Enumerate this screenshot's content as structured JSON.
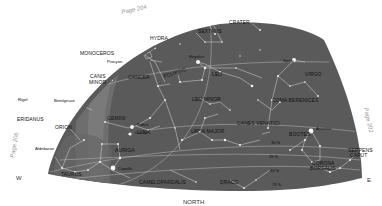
{
  "map": {
    "title": "Star chart - northern sky hemisphere",
    "colors": {
      "sky": "#5a5a5a",
      "milky_way": "#6e6e6e",
      "milky_way_core": "#7a7a7a",
      "constellation_lines": "#d8d8d8",
      "stars": "#f4f4f4",
      "labels": "#111111",
      "page_refs": "#999999"
    },
    "page_refs": {
      "top": "Page 204",
      "left": "Page 206",
      "right": "Page 202"
    },
    "directions": {
      "west": "W",
      "east": "E",
      "north": "NORTH"
    },
    "constellations": {
      "crater": "CRATER",
      "sextans": "SEXTANS",
      "hydra": "HYDRA",
      "monoceros": "MONOCEROS",
      "canis_minor_1": "CANIS",
      "canis_minor_2": "MINOR",
      "cancer": "CANCER",
      "ecliptic": "ECLIPTIC",
      "leo": "LEO",
      "virgo": "VIRGO",
      "leo_minor": "LEO MINOR",
      "coma_berenices": "COMA BERENICES",
      "gemini": "GEMINI",
      "orion": "ORION",
      "eridanus": "ERIDANUS",
      "lynx": "LYNX",
      "canes_venatici": "CANES VENATICI",
      "ursa_major": "URSA MAJOR",
      "bootes": "BOOTES",
      "auriga": "AURIGA",
      "serpens_caput_1": "SERPENS",
      "serpens_caput_2": "CAPUT",
      "corona_borealis_1": "CORONA",
      "corona_borealis_2": "BOREALIS",
      "taurus": "TAURUS",
      "camelopardalis": "CAMELOPARDALIS",
      "draco": "DRACO"
    },
    "stars": {
      "procyon": "Procyon",
      "regulus": "Regulus",
      "spica": "Spica",
      "rigel": "Rigel",
      "betelgeuse": "Betelgeuse",
      "pollux": "Pollux",
      "castor": "Castor",
      "aldebaran": "Aldebaran",
      "capella": "Capella",
      "arcturus": "Arcturus"
    },
    "declination_marks": {
      "d30": "30°S",
      "d45": "45°S",
      "d60": "60°S",
      "d75": "75°S"
    }
  }
}
